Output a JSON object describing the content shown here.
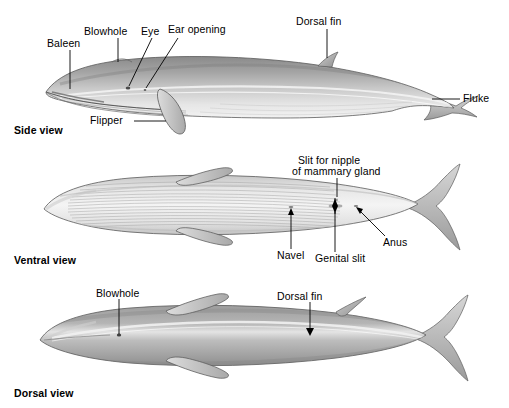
{
  "figure": {
    "colors": {
      "ink": "#000000",
      "body_dark": "#8d8d8d",
      "body_mid": "#b9b9b9",
      "body_light": "#ededed",
      "outline": "#5f5f5f",
      "groove": "#9a9a9a",
      "background": "#ffffff"
    }
  },
  "views": [
    {
      "id": "side",
      "title": "Side view",
      "labels": [
        {
          "name": "baleen",
          "text": "Baleen"
        },
        {
          "name": "blowhole",
          "text": "Blowhole"
        },
        {
          "name": "eye",
          "text": "Eye"
        },
        {
          "name": "ear-opening",
          "text": "Ear opening"
        },
        {
          "name": "dorsal-fin",
          "text": "Dorsal fin"
        },
        {
          "name": "fluke",
          "text": "Fluke"
        },
        {
          "name": "flipper",
          "text": "Flipper"
        }
      ]
    },
    {
      "id": "ventral",
      "title": "Ventral view",
      "labels": [
        {
          "name": "slit-for-nipple",
          "text": "Slit for nipple"
        },
        {
          "name": "of-mammary-gland",
          "text": "of mammary gland"
        },
        {
          "name": "navel",
          "text": "Navel"
        },
        {
          "name": "genital-slit",
          "text": "Genital slit"
        },
        {
          "name": "anus",
          "text": "Anus"
        }
      ]
    },
    {
      "id": "dorsal",
      "title": "Dorsal view",
      "labels": [
        {
          "name": "blowhole",
          "text": "Blowhole"
        },
        {
          "name": "dorsal-fin",
          "text": "Dorsal fin"
        }
      ]
    }
  ],
  "side_view": {
    "title": "Side view",
    "baleen": "Baleen",
    "blowhole": "Blowhole",
    "eye": "Eye",
    "ear_opening": "Ear opening",
    "dorsal_fin": "Dorsal fin",
    "fluke": "Fluke",
    "flipper": "Flipper"
  },
  "ventral_view": {
    "title": "Ventral view",
    "nipple_line1": "Slit for nipple",
    "nipple_line2": "of mammary gland",
    "navel": "Navel",
    "genital_slit": "Genital slit",
    "anus": "Anus"
  },
  "dorsal_view": {
    "title": "Dorsal view",
    "blowhole": "Blowhole",
    "dorsal_fin": "Dorsal fin"
  }
}
